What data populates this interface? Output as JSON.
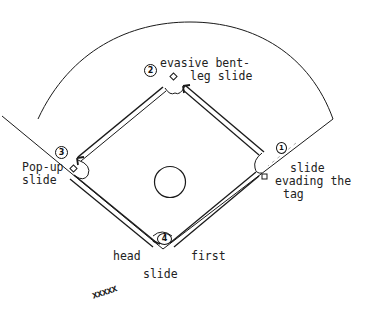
{
  "diagram": {
    "line_color": "#1a1a1a",
    "bases": [
      {
        "number": "1",
        "position": "first base",
        "label_lines": [
          "slide",
          "evading the",
          "tag"
        ]
      },
      {
        "number": "2",
        "position": "second base",
        "label_lines": [
          "evasive bent-",
          "leg slide"
        ]
      },
      {
        "number": "3",
        "position": "third base",
        "label_lines": [
          "Pop-up",
          "slide"
        ]
      },
      {
        "number": "4",
        "position": "home plate",
        "label_lines": [
          "head",
          "first",
          "slide"
        ]
      }
    ],
    "labels": {
      "second_line1": "evasive bent-",
      "second_line2": "leg slide",
      "third_line1": "Pop-up",
      "third_line2": "slide",
      "first_line1": "slide",
      "first_line2": "evading the",
      "first_line3": "tag",
      "home_left": "head",
      "home_right": "first",
      "home_bottom": "slide",
      "on_deck_marks": "xxxxx"
    },
    "markers": {
      "first": "1",
      "second": "2",
      "third": "3",
      "home": "4"
    },
    "elements": [
      "outfield-arc",
      "foul-lines",
      "base-paths",
      "pitchers-mound",
      "runner-path-arrows"
    ]
  }
}
